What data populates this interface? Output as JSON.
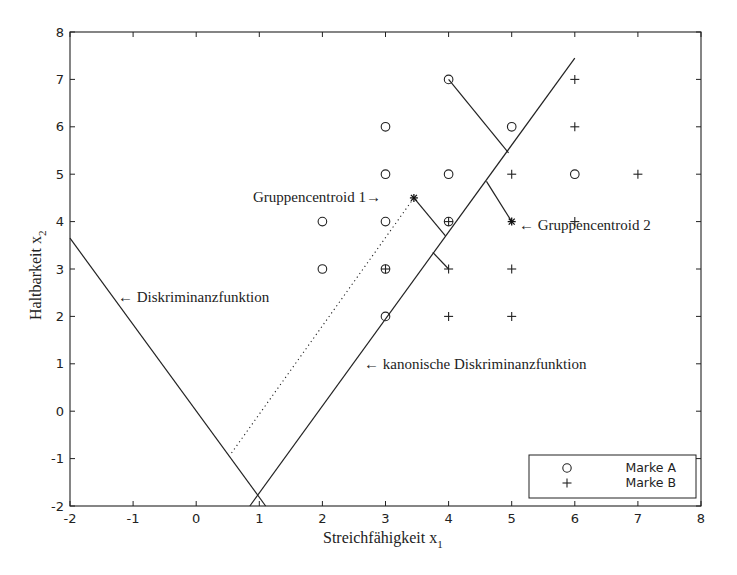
{
  "chart_data": {
    "type": "scatter",
    "title": "",
    "xlabel": "Streichfähigkeit x",
    "xlabel_sub": "1",
    "ylabel": "Haltbarkeit x",
    "ylabel_sub": "2",
    "xlim": [
      -2,
      8
    ],
    "ylim": [
      -2,
      8
    ],
    "xticks": [
      -2,
      -1,
      0,
      1,
      2,
      3,
      4,
      5,
      6,
      7,
      8
    ],
    "yticks": [
      -2,
      -1,
      0,
      1,
      2,
      3,
      4,
      5,
      6,
      7,
      8
    ],
    "grid": false,
    "legend_position": "lower right",
    "series": [
      {
        "name": "Marke A",
        "marker": "o",
        "points": [
          [
            2,
            4
          ],
          [
            2,
            3
          ],
          [
            3,
            6
          ],
          [
            3,
            5
          ],
          [
            3,
            4
          ],
          [
            3,
            3
          ],
          [
            3,
            2
          ],
          [
            4,
            7
          ],
          [
            4,
            5
          ],
          [
            4,
            4
          ],
          [
            5,
            6
          ],
          [
            6,
            5
          ]
        ]
      },
      {
        "name": "Marke B",
        "marker": "+",
        "points": [
          [
            6,
            7
          ],
          [
            6,
            6
          ],
          [
            5,
            5
          ],
          [
            7,
            5
          ],
          [
            6,
            4
          ],
          [
            3,
            3
          ],
          [
            4,
            4
          ],
          [
            4,
            3
          ],
          [
            5,
            3
          ],
          [
            4,
            2
          ],
          [
            5,
            2
          ]
        ]
      }
    ],
    "centroids": [
      {
        "label": "Gruppencentroid 1",
        "point": [
          3.45,
          4.5
        ]
      },
      {
        "label": "Gruppencentroid 2",
        "point": [
          5.0,
          4.0
        ]
      }
    ],
    "lines": [
      {
        "label": "Diskriminanzfunktion",
        "style": "solid",
        "from": [
          -2,
          3.65
        ],
        "to": [
          1.1,
          -2
        ]
      },
      {
        "label": "kanonische Diskriminanzfunktion",
        "style": "solid",
        "from": [
          0.85,
          -2
        ],
        "to": [
          6.0,
          7.45
        ]
      },
      {
        "label": "",
        "style": "dotted",
        "from": [
          3.45,
          4.5
        ],
        "to": [
          0.55,
          -0.9
        ]
      }
    ],
    "projection_segments": [
      {
        "from": [
          4.0,
          7.0
        ],
        "to": [
          4.95,
          5.45
        ]
      },
      {
        "from": [
          3.45,
          4.5
        ],
        "to": [
          3.95,
          3.7
        ]
      },
      {
        "from": [
          4.6,
          4.85
        ],
        "to": [
          5.0,
          4.0
        ]
      },
      {
        "from": [
          3.75,
          3.35
        ],
        "to": [
          4.0,
          3.0
        ]
      }
    ],
    "annotations": [
      {
        "text": "Gruppencentroid 1→",
        "at": [
          3.35,
          4.5
        ]
      },
      {
        "text": "← Gruppencentroid 2",
        "at": [
          5.1,
          3.95
        ]
      },
      {
        "text": "← Diskriminanzfunktion",
        "at": [
          -1.3,
          2.4
        ]
      },
      {
        "text": "← kanonische Diskriminanzfunktion",
        "at": [
          1.9,
          1.0
        ]
      }
    ]
  },
  "labels": {
    "xlabel": "Streichfähigkeit x",
    "xlabel_sub": "1",
    "ylabel": "Haltbarkeit x",
    "ylabel_sub": "2",
    "legend_a": "Marke A",
    "legend_b": "Marke B",
    "centroid1": "Gruppencentroid 1→",
    "centroid2": "← Gruppencentroid 2",
    "diskriminanz": "← Diskriminanzfunktion",
    "kanonisch": "← kanonische Diskriminanzfunktion"
  }
}
